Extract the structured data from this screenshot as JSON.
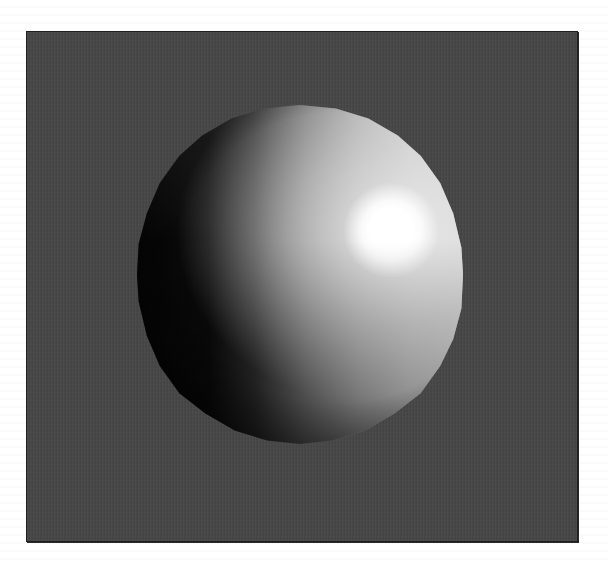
{
  "figure": {
    "background_color": "#454545",
    "frame_border_color": "#1e1e1e",
    "page_color": "#ffffff",
    "sphere": {
      "center_px": [
        299,
        273
      ],
      "width_px": 326,
      "height_px": 339,
      "shadow_color": "#050505",
      "lit_color": "#d7d7d7",
      "highlight_color": "#ffffff",
      "highlight_center_px": [
        390,
        230
      ],
      "highlight_radius_px": 32,
      "light_direction": "upper-right"
    }
  }
}
